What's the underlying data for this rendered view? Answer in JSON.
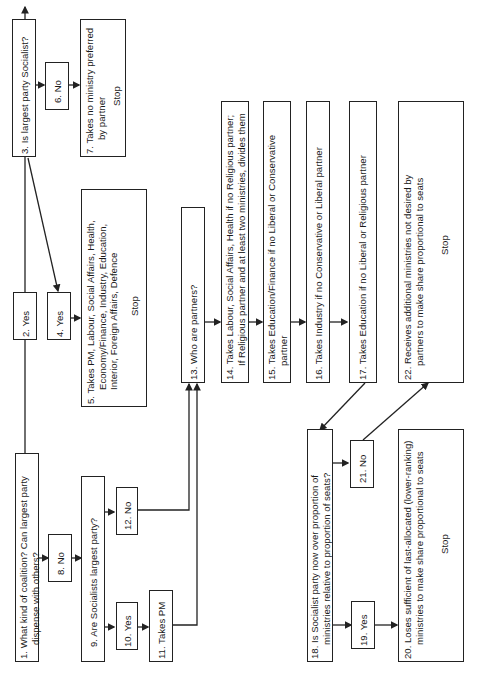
{
  "diagram": {
    "type": "flowchart",
    "orientation": "rotated-90-ccw",
    "nodes": [
      {
        "id": 1,
        "lines": [
          "1. What kind of coalition? Can largest party",
          "dispense with others?"
        ]
      },
      {
        "id": 2,
        "lines": [
          "2. Yes"
        ]
      },
      {
        "id": 3,
        "lines": [
          "3. Is largest party Socialist?"
        ]
      },
      {
        "id": 4,
        "lines": [
          "4. Yes"
        ]
      },
      {
        "id": 5,
        "lines": [
          "5. Takes PM, Labour, Social Affairs, Health,",
          "Economy/Finance, Industry, Education,",
          "Interior, Foreign Affairs, Defence"
        ],
        "stop": "Stop"
      },
      {
        "id": 6,
        "lines": [
          "6. No"
        ]
      },
      {
        "id": 7,
        "lines": [
          "7. Takes no ministry preferred",
          "by partner"
        ],
        "stop": "Stop"
      },
      {
        "id": 8,
        "lines": [
          "8. No"
        ]
      },
      {
        "id": 9,
        "lines": [
          "9. Are Socialists largest party?"
        ]
      },
      {
        "id": 10,
        "lines": [
          "10. Yes"
        ]
      },
      {
        "id": 11,
        "lines": [
          "11. Takes PM"
        ]
      },
      {
        "id": 12,
        "lines": [
          "12. No"
        ]
      },
      {
        "id": 13,
        "lines": [
          "13. Who are partners?"
        ]
      },
      {
        "id": 14,
        "lines": [
          "14. Takes Labour, Social Affairs, Health if no Religious partner;",
          "If Religious partner and at least two ministries, divides them"
        ]
      },
      {
        "id": 15,
        "lines": [
          "15. Takes Education/Finance if no Liberal or Conservative",
          "partner"
        ]
      },
      {
        "id": 16,
        "lines": [
          "16. Takes Industry if no Conservative or Liberal partner"
        ]
      },
      {
        "id": 17,
        "lines": [
          "17. Takes Education if no Liberal or Religious partner"
        ]
      },
      {
        "id": 18,
        "lines": [
          "18. Is Socialist party now over proportion of",
          "ministries relative to proportion of seats?"
        ]
      },
      {
        "id": 19,
        "lines": [
          "19. Yes"
        ]
      },
      {
        "id": 20,
        "lines": [
          "20. Loses sufficient of last-allocated (lower-ranking)",
          "ministries to make share proportional to seats"
        ],
        "stop": "Stop"
      },
      {
        "id": 21,
        "lines": [
          "21. No"
        ]
      },
      {
        "id": 22,
        "lines": [
          "22. Receives additional ministries not desired by",
          "partners to make share proportional to seats"
        ],
        "stop": "Stop"
      }
    ],
    "edges": [
      [
        1,
        2
      ],
      [
        2,
        3
      ],
      [
        3,
        4
      ],
      [
        3,
        6
      ],
      [
        4,
        5
      ],
      [
        6,
        7
      ],
      [
        1,
        8
      ],
      [
        8,
        9
      ],
      [
        9,
        10
      ],
      [
        9,
        12
      ],
      [
        10,
        11
      ],
      [
        11,
        13
      ],
      [
        12,
        13
      ],
      [
        13,
        14
      ],
      [
        14,
        15
      ],
      [
        15,
        16
      ],
      [
        16,
        17
      ],
      [
        17,
        18
      ],
      [
        18,
        19
      ],
      [
        18,
        21
      ],
      [
        19,
        20
      ],
      [
        21,
        22
      ]
    ]
  }
}
